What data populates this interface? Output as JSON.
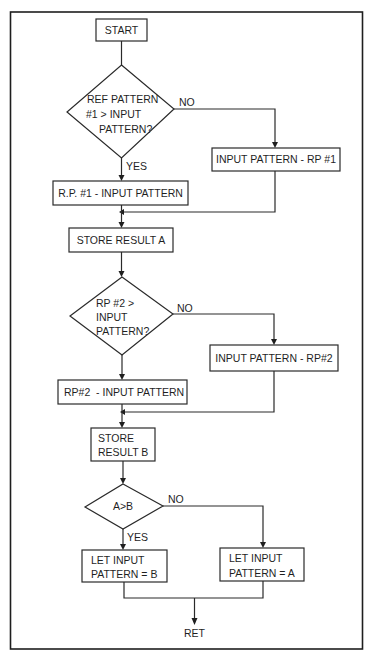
{
  "diagram": {
    "type": "flowchart",
    "nodes": {
      "start": {
        "label": "START"
      },
      "decision1": {
        "lines": [
          "REF PATTERN",
          "#1 > INPUT",
          "PATTERN?"
        ]
      },
      "decision1_no": {
        "label": "NO"
      },
      "decision1_yes": {
        "label": "YES"
      },
      "proc_input_minus_rp1": {
        "label": "INPUT PATTERN - RP #1"
      },
      "proc_rp1_minus_input": {
        "label": "R.P. #1 - INPUT PATTERN"
      },
      "store_a": {
        "label": "STORE RESULT A"
      },
      "decision2": {
        "lines": [
          "RP #2 >",
          "INPUT",
          "PATTERN?"
        ]
      },
      "decision2_no": {
        "label": "NO"
      },
      "proc_input_minus_rp2": {
        "label": "INPUT PATTERN - RP#2"
      },
      "proc_rp2_minus_input": {
        "label": "RP#2  - INPUT PATTERN"
      },
      "store_b": {
        "lines": [
          "STORE",
          "RESULT B"
        ]
      },
      "decision3": {
        "label": "A>B"
      },
      "decision3_no": {
        "label": "NO"
      },
      "decision3_yes": {
        "label": "YES"
      },
      "let_b": {
        "lines": [
          "LET INPUT",
          "PATTERN = B"
        ]
      },
      "let_a": {
        "lines": [
          "LET INPUT",
          "PATTERN = A"
        ]
      },
      "ret": {
        "label": "RET"
      }
    },
    "edges": [
      {
        "from": "start",
        "to": "decision1"
      },
      {
        "from": "decision1",
        "to": "proc_rp1_minus_input",
        "label": "YES"
      },
      {
        "from": "decision1",
        "to": "proc_input_minus_rp1",
        "label": "NO"
      },
      {
        "from": "proc_rp1_minus_input",
        "to": "store_a"
      },
      {
        "from": "proc_input_minus_rp1",
        "to": "store_a"
      },
      {
        "from": "store_a",
        "to": "decision2"
      },
      {
        "from": "decision2",
        "to": "proc_rp2_minus_input"
      },
      {
        "from": "decision2",
        "to": "proc_input_minus_rp2",
        "label": "NO"
      },
      {
        "from": "proc_rp2_minus_input",
        "to": "store_b"
      },
      {
        "from": "proc_input_minus_rp2",
        "to": "store_b"
      },
      {
        "from": "store_b",
        "to": "decision3"
      },
      {
        "from": "decision3",
        "to": "let_b",
        "label": "YES"
      },
      {
        "from": "decision3",
        "to": "let_a",
        "label": "NO"
      },
      {
        "from": "let_b",
        "to": "ret"
      },
      {
        "from": "let_a",
        "to": "ret"
      }
    ]
  },
  "colors": {
    "line": "#2a2a2a",
    "background": "#ffffff"
  }
}
